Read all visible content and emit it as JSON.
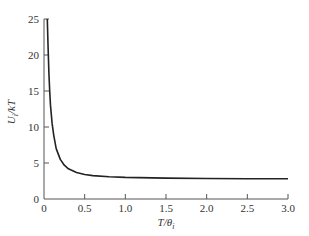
{
  "chart_data": {
    "type": "line",
    "title": "",
    "xlabel": "T/θ_i",
    "ylabel": "U_i/kT",
    "xlim": [
      0,
      3.0
    ],
    "ylim": [
      0,
      25
    ],
    "grid": false,
    "legend": null,
    "x_ticks": [
      "0",
      "0.5",
      "1.0",
      "1.5",
      "2.0",
      "2.5",
      "3.0"
    ],
    "y_ticks": [
      "0",
      "5",
      "10",
      "15",
      "20",
      "25"
    ],
    "series": [
      {
        "name": "U_i/kT",
        "x": [
          0.04,
          0.05,
          0.06,
          0.07,
          0.08,
          0.1,
          0.12,
          0.15,
          0.2,
          0.25,
          0.3,
          0.4,
          0.5,
          0.6,
          0.8,
          1.0,
          1.5,
          2.0,
          2.5,
          3.0
        ],
        "y": [
          25,
          21,
          17.5,
          15,
          13,
          10.5,
          8.8,
          7.0,
          5.5,
          4.7,
          4.2,
          3.7,
          3.4,
          3.25,
          3.1,
          3.0,
          2.9,
          2.85,
          2.82,
          2.8
        ]
      }
    ]
  },
  "labels": {
    "xlabel_main": "T/θ",
    "xlabel_sub": "i",
    "ylabel_main": "U",
    "ylabel_sub": "i",
    "ylabel_rest": "/kT"
  }
}
